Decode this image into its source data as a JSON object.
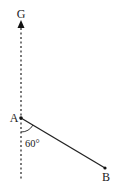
{
  "diagram": {
    "points": {
      "G": {
        "label": "G",
        "x": 21,
        "y": 14
      },
      "A": {
        "label": "A",
        "x": 21,
        "y": 118
      },
      "B": {
        "label": "B",
        "x": 105,
        "y": 168
      }
    },
    "angle": {
      "label": "60°",
      "value": 60,
      "between": [
        "AG",
        "AB"
      ]
    },
    "colors": {
      "stroke": "#222222",
      "background": "#ffffff"
    }
  }
}
